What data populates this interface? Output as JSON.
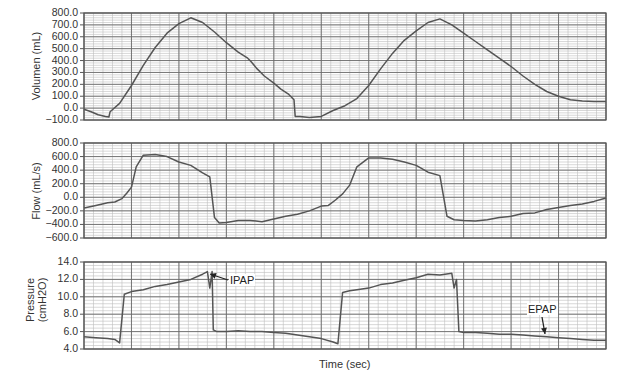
{
  "chart_data": [
    {
      "type": "line",
      "panel": "volume",
      "ylabel": "Volumen (mL)",
      "xlabel": "",
      "ylim": [
        -100,
        800
      ],
      "yticks": [
        "800.0",
        "700.0",
        "600.0",
        "500.0",
        "400.0",
        "300.0",
        "200.0",
        "100.0",
        "0.0",
        "−100.0"
      ],
      "grid": true,
      "x": [
        0.0,
        0.3,
        0.6,
        0.9,
        1.05,
        1.1,
        1.5,
        2.0,
        2.5,
        3.0,
        3.5,
        4.0,
        4.5,
        5.0,
        5.5,
        6.0,
        6.5,
        6.9,
        7.0,
        7.3,
        7.6,
        8.0,
        8.3,
        8.6,
        8.8,
        8.85,
        8.9,
        9.1,
        9.5,
        10.0,
        10.5,
        11.0,
        11.5,
        12.0,
        12.5,
        13.0,
        13.5,
        14.0,
        14.5,
        15.0,
        15.5,
        16.0,
        16.5,
        17.0,
        17.5,
        18.0,
        18.5,
        19.0,
        19.5,
        20.0,
        20.5,
        21.0,
        21.5,
        22.0
      ],
      "series": [
        {
          "name": "Volume",
          "values": [
            -10,
            -30,
            -55,
            -70,
            -75,
            -30,
            40,
            190,
            360,
            510,
            630,
            710,
            760,
            720,
            640,
            550,
            470,
            420,
            400,
            330,
            270,
            210,
            160,
            120,
            80,
            70,
            -70,
            -70,
            -80,
            -70,
            -20,
            20,
            80,
            190,
            330,
            460,
            570,
            650,
            720,
            750,
            700,
            630,
            560,
            490,
            420,
            350,
            270,
            200,
            140,
            100,
            70,
            60,
            55,
            55
          ]
        }
      ]
    },
    {
      "type": "line",
      "panel": "flow",
      "ylabel": "Flow (mL/s)",
      "xlabel": "",
      "ylim": [
        -600,
        800
      ],
      "yticks": [
        "800.0",
        "600.0",
        "400.0",
        "200.0",
        "0.0",
        "−200.0",
        "−400.0",
        "−600.0"
      ],
      "grid": true,
      "x": [
        0.0,
        0.5,
        1.0,
        1.3,
        1.6,
        1.8,
        2.0,
        2.2,
        2.5,
        3.0,
        3.5,
        4.0,
        4.5,
        5.0,
        5.3,
        5.5,
        5.7,
        6.0,
        6.5,
        7.0,
        7.5,
        8.0,
        8.5,
        9.0,
        9.5,
        10.0,
        10.3,
        10.6,
        10.9,
        11.2,
        11.5,
        12.0,
        12.5,
        13.0,
        13.5,
        14.0,
        14.5,
        15.0,
        15.3,
        15.6,
        16.0,
        16.5,
        17.0,
        17.5,
        18.0,
        18.5,
        19.0,
        19.5,
        20.0,
        20.5,
        21.0,
        21.5,
        22.0
      ],
      "series": [
        {
          "name": "Flow",
          "values": [
            -160,
            -120,
            -80,
            -70,
            -20,
            60,
            150,
            450,
            620,
            630,
            600,
            520,
            470,
            360,
            300,
            -300,
            -380,
            -370,
            -340,
            -340,
            -360,
            -320,
            -280,
            -250,
            -200,
            -130,
            -120,
            -40,
            50,
            180,
            450,
            580,
            580,
            560,
            520,
            470,
            370,
            320,
            -280,
            -330,
            -340,
            -350,
            -330,
            -300,
            -280,
            -240,
            -230,
            -180,
            -150,
            -120,
            -100,
            -60,
            -10
          ]
        }
      ]
    },
    {
      "type": "line",
      "panel": "pressure",
      "ylabel": "Pressure (cmH2O)",
      "xlabel": "Time (sec)",
      "ylim": [
        4,
        14
      ],
      "yticks": [
        "14.0",
        "12.0",
        "10.0",
        "8.0",
        "6.0",
        "4.0"
      ],
      "grid": true,
      "x": [
        0.0,
        0.5,
        1.0,
        1.3,
        1.5,
        1.7,
        2.0,
        2.5,
        3.0,
        3.5,
        4.0,
        4.5,
        5.0,
        5.2,
        5.3,
        5.4,
        5.45,
        5.6,
        6.0,
        6.5,
        7.0,
        7.5,
        8.0,
        8.5,
        9.0,
        9.5,
        10.0,
        10.5,
        10.7,
        10.9,
        11.2,
        11.5,
        12.0,
        12.5,
        13.0,
        13.5,
        14.0,
        14.5,
        15.0,
        15.5,
        15.6,
        15.7,
        15.8,
        16.0,
        16.5,
        17.0,
        17.5,
        18.0,
        18.5,
        19.0,
        19.5,
        20.0,
        20.5,
        21.0,
        21.5,
        22.0
      ],
      "series": [
        {
          "name": "Pressure",
          "values": [
            5.4,
            5.3,
            5.2,
            5.1,
            4.7,
            10.3,
            10.6,
            10.8,
            11.2,
            11.4,
            11.7,
            12.0,
            12.6,
            12.9,
            11.0,
            12.9,
            6.2,
            6.0,
            6.0,
            6.1,
            6.0,
            6.0,
            5.9,
            5.8,
            5.6,
            5.4,
            5.2,
            4.8,
            4.6,
            10.5,
            10.7,
            10.8,
            11.0,
            11.4,
            11.6,
            11.9,
            12.2,
            12.6,
            12.5,
            12.7,
            11.0,
            12.0,
            6.0,
            5.9,
            5.9,
            5.8,
            5.7,
            5.7,
            5.6,
            5.5,
            5.4,
            5.3,
            5.2,
            5.1,
            5.0,
            5.0
          ]
        }
      ],
      "annotations": [
        {
          "text": "IPAP",
          "target": "peak pressure breath 1"
        },
        {
          "text": "EPAP",
          "target": "baseline pressure breath 2"
        }
      ]
    }
  ],
  "labels": {
    "volume_ylabel": "Volumen (mL)",
    "flow_ylabel": "Flow (mL/s)",
    "pressure_ylabel_line1": "Pressure",
    "pressure_ylabel_line2": "(cmH2O)",
    "xlabel": "Time (sec)",
    "ipap": "IPAP",
    "epap": "EPAP"
  },
  "style": {
    "line_color": "#555555",
    "grid_major": "#6a6a6a",
    "grid_minor": "#bdbdbd",
    "frame": "#555555"
  }
}
